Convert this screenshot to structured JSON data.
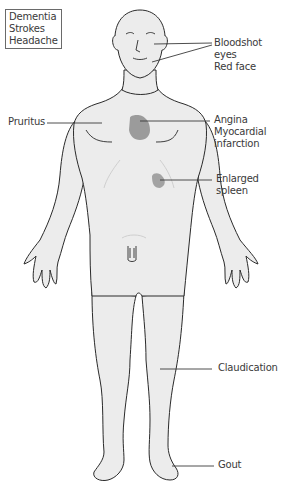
{
  "diagram": {
    "colors": {
      "skin": "#ececec",
      "outline": "#2a2a2a",
      "highlight": "#9b9b9b",
      "leader": "#3a3a3a"
    },
    "labels": {
      "head_box": [
        "Dementia",
        "Strokes",
        "Headache"
      ],
      "eyes_face": [
        "Bloodshot",
        "eyes",
        "Red face"
      ],
      "pruritus": [
        "Pruritus"
      ],
      "heart": [
        "Angina",
        "Myocardial",
        "infarction"
      ],
      "spleen": [
        "Enlarged",
        "spleen"
      ],
      "leg": [
        "Claudication"
      ],
      "foot": [
        "Gout"
      ]
    }
  }
}
